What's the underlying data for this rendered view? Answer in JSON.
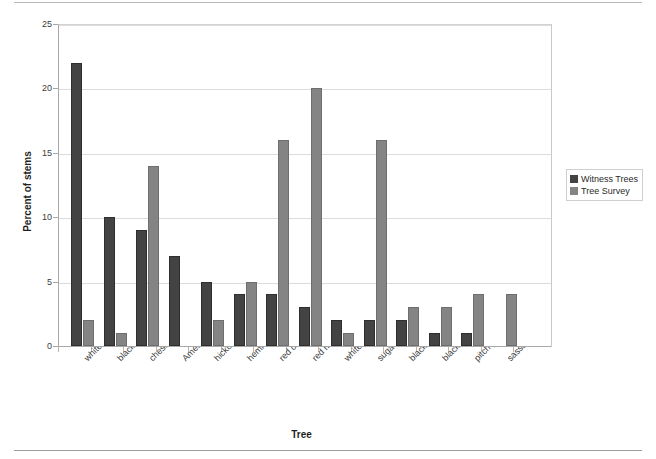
{
  "chart_data": {
    "type": "bar",
    "title": "",
    "xlabel": "Tree",
    "ylabel": "Percent of stems",
    "ylim": [
      0,
      25
    ],
    "yticks": [
      0,
      5,
      10,
      15,
      20,
      25
    ],
    "grid": true,
    "legend_position": "right",
    "categories": [
      "white oak",
      "black oak",
      "chestnut oak",
      "American chestnut",
      "hickory",
      "hemlock",
      "red oak",
      "red maple",
      "white ash",
      "sugar maple",
      "black gum",
      "black birch",
      "pitch pine",
      "sassafras"
    ],
    "series": [
      {
        "name": "Witness Trees",
        "color": "#434343",
        "values": [
          22,
          10,
          9,
          7,
          5,
          4,
          4,
          3,
          2,
          2,
          2,
          1,
          1,
          0
        ]
      },
      {
        "name": "Tree Survey",
        "color": "#848484",
        "values": [
          2,
          1,
          14,
          0,
          2,
          5,
          16,
          20,
          1,
          16,
          3,
          3,
          4,
          4
        ]
      }
    ]
  },
  "legend": {
    "items": [
      {
        "label": "Witness Trees",
        "color": "#434343"
      },
      {
        "label": "Tree Survey",
        "color": "#848484"
      }
    ]
  }
}
